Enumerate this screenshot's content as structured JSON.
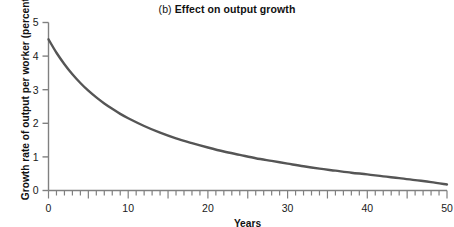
{
  "chart_data": {
    "type": "line",
    "title": "(b) Effect on output growth",
    "title_panel_letter": "(b)",
    "title_text": "Effect on output growth",
    "xlabel": "Years",
    "ylabel": "Growth rate of output per worker (percent)",
    "xlim": [
      0,
      50
    ],
    "ylim": [
      0,
      5
    ],
    "grid": false,
    "legend": null,
    "x_ticks": [
      0,
      10,
      20,
      30,
      40,
      50
    ],
    "x_tick_labels": [
      "0",
      "10",
      "20",
      "30",
      "40",
      "50"
    ],
    "x_minor_tick_interval": 1,
    "x_major_tick_interval": 5,
    "y_ticks": [
      0,
      1,
      2,
      3,
      4,
      5
    ],
    "y_tick_labels": [
      "0",
      "1",
      "2",
      "3",
      "4",
      "5"
    ],
    "line_color": "#555555",
    "line_width": 2.4,
    "axis_color": "#808080",
    "background": "#ffffff",
    "series": [
      {
        "name": "Growth rate of output per worker",
        "x": [
          0,
          1,
          2,
          3,
          4,
          5,
          6,
          7,
          8,
          9,
          10,
          12,
          14,
          16,
          18,
          20,
          22,
          24,
          26,
          28,
          30,
          32,
          34,
          36,
          38,
          40,
          42,
          44,
          46,
          48,
          50
        ],
        "values": [
          4.5,
          4.1,
          3.76,
          3.46,
          3.2,
          2.97,
          2.77,
          2.59,
          2.43,
          2.28,
          2.15,
          1.92,
          1.72,
          1.55,
          1.41,
          1.28,
          1.16,
          1.06,
          0.96,
          0.88,
          0.8,
          0.72,
          0.65,
          0.59,
          0.53,
          0.48,
          0.42,
          0.37,
          0.31,
          0.25,
          0.18
        ]
      }
    ]
  }
}
